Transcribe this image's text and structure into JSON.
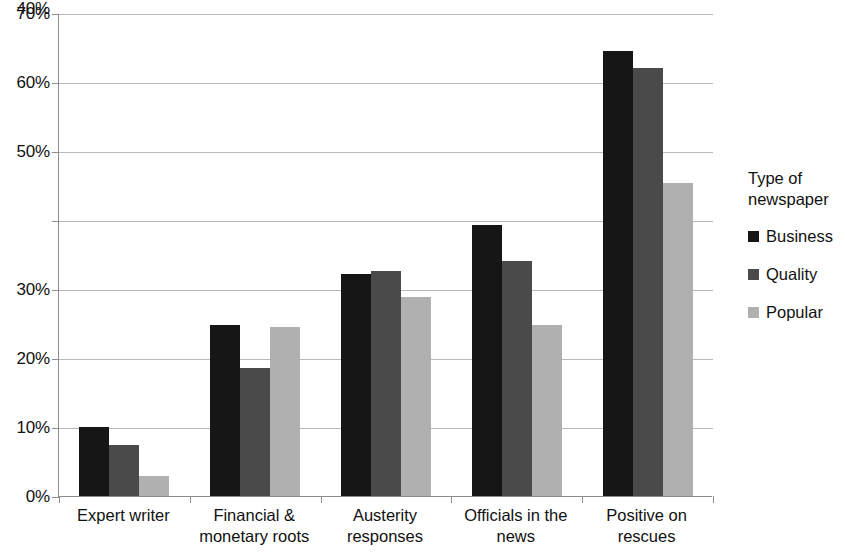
{
  "chart_data": {
    "type": "bar",
    "title": "",
    "subtitle": "",
    "xlabel": "",
    "ylabel": "",
    "categories": [
      "Expert writer",
      "Financial &\nmonetary roots",
      "Austerity\nresponses",
      "Officials in the\nnews",
      "Positive on\nrescues"
    ],
    "series": [
      {
        "name": "Business",
        "color": "#161616",
        "values": [
          10.0,
          24.8,
          32.2,
          39.3,
          64.5
        ]
      },
      {
        "name": "Quality",
        "color": "#4a4a4a",
        "values": [
          7.4,
          18.5,
          32.6,
          34.0,
          62.0
        ]
      },
      {
        "name": "Popular",
        "color": "#b0b0b0",
        "values": [
          2.9,
          24.5,
          28.9,
          24.8,
          45.3
        ]
      }
    ],
    "ylim": [
      0,
      70
    ],
    "ytick_labels": [
      "0%",
      "10%",
      "20%",
      "30%",
      "40%",
      "50%",
      "60%",
      "70%"
    ],
    "ytick_values": [
      0,
      10,
      20,
      30,
      40,
      50,
      60,
      70
    ],
    "grid": true,
    "legend_position": "right"
  },
  "legend": {
    "title": "Type of\nnewspaper",
    "entries": [
      {
        "label": "Business"
      },
      {
        "label": "Quality"
      },
      {
        "label": "Popular"
      }
    ]
  }
}
